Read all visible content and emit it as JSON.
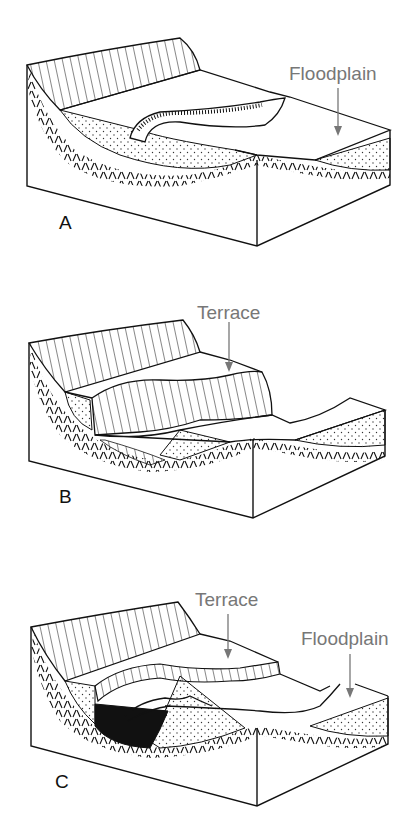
{
  "figure": {
    "panels": [
      {
        "letter": "A",
        "labels": [
          {
            "text": "Floodplain"
          }
        ]
      },
      {
        "letter": "B",
        "labels": [
          {
            "text": "Terrace"
          }
        ]
      },
      {
        "letter": "C",
        "labels": [
          {
            "text": "Terrace"
          },
          {
            "text": "Floodplain"
          }
        ]
      }
    ]
  },
  "colors": {
    "line": "#111111",
    "label": "#777777",
    "background": "#ffffff"
  }
}
